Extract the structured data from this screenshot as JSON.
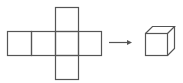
{
  "diagram": {
    "stroke_color": "#555555",
    "background": "#ffffff",
    "net": {
      "faces": [
        {
          "id": "top",
          "x": 55,
          "y": 7,
          "w": 23,
          "h": 24
        },
        {
          "id": "row-1",
          "x": 7,
          "y": 31,
          "w": 24,
          "h": 24
        },
        {
          "id": "row-2",
          "x": 31,
          "y": 31,
          "w": 24,
          "h": 24
        },
        {
          "id": "row-3",
          "x": 55,
          "y": 31,
          "w": 23,
          "h": 24
        },
        {
          "id": "row-4",
          "x": 78,
          "y": 31,
          "w": 23,
          "h": 24
        },
        {
          "id": "bottom",
          "x": 55,
          "y": 55,
          "w": 23,
          "h": 24
        }
      ]
    },
    "arrow": {
      "x1": 109,
      "y1": 42,
      "x2": 132,
      "y2": 42
    },
    "cube": {
      "x": 145,
      "y": 33,
      "size": 22,
      "depth": 7
    }
  }
}
